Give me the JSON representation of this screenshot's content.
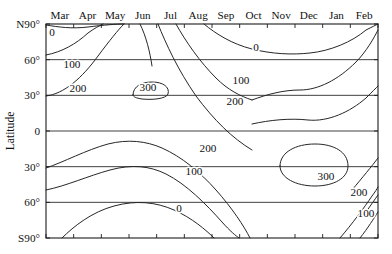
{
  "figure": {
    "type": "contour-plot",
    "background_color": "#ffffff",
    "line_color": "#262626"
  },
  "axes": {
    "y_title": "Latitude",
    "x_tick_labels": [
      "Mar",
      "Apr",
      "May",
      "Jun",
      "Jul",
      "Aug",
      "Sep",
      "Oct",
      "Nov",
      "Dec",
      "Jan",
      "Feb"
    ],
    "y_tick_labels": [
      "N90°",
      "60°",
      "30°",
      "0",
      "30°",
      "60°",
      "S90°"
    ],
    "y_tick_values": [
      90,
      60,
      30,
      0,
      -30,
      -60,
      -90
    ]
  },
  "contour_labels": [
    {
      "text": "0",
      "x": 52,
      "y": 36,
      "rotate": 0
    },
    {
      "text": "100",
      "x": 72,
      "y": 68,
      "rotate": 0
    },
    {
      "text": "200",
      "x": 78,
      "y": 92,
      "rotate": 0
    },
    {
      "text": "300",
      "x": 148,
      "y": 91,
      "rotate": 0
    },
    {
      "text": "0",
      "x": 256,
      "y": 51,
      "rotate": 0
    },
    {
      "text": "100",
      "x": 241,
      "y": 84,
      "rotate": 0
    },
    {
      "text": "200",
      "x": 235,
      "y": 105,
      "rotate": 0
    },
    {
      "text": "200",
      "x": 208,
      "y": 152,
      "rotate": 0
    },
    {
      "text": "100",
      "x": 194,
      "y": 175,
      "rotate": 0
    },
    {
      "text": "300",
      "x": 326,
      "y": 180,
      "rotate": 0
    },
    {
      "text": "0",
      "x": 179,
      "y": 212,
      "rotate": 0
    },
    {
      "text": "200",
      "x": 359,
      "y": 196,
      "rotate": 0
    },
    {
      "text": "100",
      "x": 366,
      "y": 217,
      "rotate": 0
    }
  ],
  "chart_data": {
    "type": "contour",
    "title": "",
    "xlabel": "",
    "ylabel": "Latitude",
    "xlim": [
      0,
      12
    ],
    "ylim": [
      -90,
      90
    ],
    "grid": true,
    "legend": "none",
    "x_unit": "month",
    "y_unit": "degrees latitude",
    "x_categories": [
      "Mar",
      "Apr",
      "May",
      "Jun",
      "Jul",
      "Aug",
      "Sep",
      "Oct",
      "Nov",
      "Dec",
      "Jan",
      "Feb"
    ],
    "y_ticks": [
      90,
      60,
      30,
      0,
      -30,
      -60,
      -90
    ],
    "contour_levels": [
      0,
      100,
      200,
      300
    ],
    "z_description": "Daily mean solar insolation at top of atmosphere (W m^-2) as a function of latitude and month",
    "annotations": [
      {
        "label": "0",
        "near_month": "Mar",
        "near_latitude": 88
      },
      {
        "label": "100",
        "near_month": "Mar",
        "near_latitude": 57
      },
      {
        "label": "200",
        "near_month": "Mar",
        "near_latitude": 33
      },
      {
        "label": "300",
        "near_month": "Jun",
        "near_latitude": 33
      },
      {
        "label": "0",
        "near_month": "Oct",
        "near_latitude": 76
      },
      {
        "label": "100",
        "near_month": "Sep",
        "near_latitude": 48
      },
      {
        "label": "200",
        "near_month": "Sep",
        "near_latitude": 29
      },
      {
        "label": "200",
        "near_month": "Aug",
        "near_latitude": -23
      },
      {
        "label": "100",
        "near_month": "Aug",
        "near_latitude": -37
      },
      {
        "label": "300",
        "near_month": "Dec",
        "near_latitude": -40
      },
      {
        "label": "0",
        "near_month": "Jul",
        "near_latitude": -62
      },
      {
        "label": "200",
        "near_month": "Feb",
        "near_latitude": -55
      },
      {
        "label": "100",
        "near_month": "Feb",
        "near_latitude": -68
      }
    ],
    "contours": [
      {
        "level": 0,
        "name": "zero-north-spring",
        "path": "M 46 25 C 58 27, 72 29, 88 27 C 104 25, 116 24, 124 24"
      },
      {
        "level": 100,
        "name": "hundred-north-spring",
        "path": "M 46 55 C 62 52, 76 44, 88 33 C 95 28, 99 26, 103 24"
      },
      {
        "level": 200,
        "name": "twohundred-north-spring",
        "path": "M 46 96 C 64 94, 82 78, 98 56 C 110 40, 118 30, 124 24"
      },
      {
        "level": 300,
        "name": "threehundred-north-closed",
        "path": "M 133 95 C 133 86, 142 82, 152 82 C 163 82, 170 87, 168 94 C 166 99, 152 100, 142 99 C 136 98, 133 97, 133 95 Z"
      },
      {
        "level": 300,
        "name": "threehundred-north-upper",
        "path": "M 140 24 C 146 36, 150 52, 152 66"
      },
      {
        "level": 200,
        "name": "twohundred-north-summer-right",
        "path": "M 158 24 C 166 44, 178 70, 196 96 C 214 120, 232 138, 252 150"
      },
      {
        "level": 100,
        "name": "hundred-north-summer-right",
        "path": "M 176 24 C 186 42, 200 62, 216 78 C 228 90, 240 96, 252 100"
      },
      {
        "level": 0,
        "name": "zero-north-autumn",
        "path": "M 204 24 C 216 34, 232 44, 252 49 C 272 54, 292 55, 310 53 C 330 51, 352 42, 366 30 C 372 27, 376 25, 378 24"
      },
      {
        "level": 100,
        "name": "hundred-north-winter",
        "path": "M 252 100 C 268 94, 284 90, 300 90 C 318 90, 338 80, 356 62 C 366 52, 374 38, 378 30"
      },
      {
        "level": 200,
        "name": "twohundred-north-winter",
        "path": "M 252 124 C 270 120, 290 118, 308 120 C 328 122, 350 112, 366 98 C 372 92, 376 88, 378 86"
      },
      {
        "level": 200,
        "name": "twohundred-south-summer",
        "path": "M 46 168 C 64 162, 86 150, 108 144 C 128 139, 146 141, 162 148 C 182 157, 200 172, 216 190 C 232 208, 244 226, 250 238"
      },
      {
        "level": 100,
        "name": "hundred-south-summer",
        "path": "M 46 190 C 66 186, 88 176, 110 170 C 132 164, 150 166, 166 174 C 186 184, 206 204, 222 222 C 230 231, 236 236, 239 238"
      },
      {
        "level": 0,
        "name": "zero-south-summer",
        "path": "M 62 238 C 74 226, 92 212, 114 206 C 136 200, 156 202, 174 210 C 192 218, 206 230, 214 238"
      },
      {
        "level": 300,
        "name": "threehundred-south-closed",
        "path": "M 280 166 C 280 152, 296 144, 315 144 C 334 144, 348 152, 348 166 C 348 178, 334 186, 315 186 C 296 186, 280 178, 280 166 Z"
      },
      {
        "level": 200,
        "name": "twohundred-south-winter-right",
        "path": "M 340 238 C 352 224, 364 208, 372 196 C 375 192, 377 189, 378 187"
      },
      {
        "level": 100,
        "name": "hundred-south-winter-right",
        "path": "M 360 238 C 368 228, 374 218, 378 212"
      },
      {
        "level": 200,
        "name": "twohundred-south-winter-edge",
        "path": "M 352 190 C 362 178, 372 166, 378 158"
      },
      {
        "level": 100,
        "name": "hundred-south-winter-edge",
        "path": "M 366 212 C 371 205, 375 199, 378 195"
      }
    ]
  },
  "geometry": {
    "plot_left": 46,
    "plot_right": 378,
    "plot_top": 24,
    "plot_bottom": 238
  }
}
